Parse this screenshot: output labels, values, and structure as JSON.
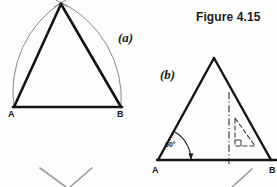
{
  "figure": {
    "title": "Figure 4.15",
    "background_color": "#fdfdfc",
    "ink_color": "#1a1a1a",
    "construction_line_color": "#6b6b6b"
  },
  "parts": [
    {
      "key": "a",
      "label": "(a)",
      "caption_position": "right-of-diagram",
      "description": "Equilateral triangle constructed on base AB using two intersecting arcs of radius AB",
      "vertices": [
        {
          "name": "A",
          "label": "A",
          "x": 14,
          "y": 107
        },
        {
          "name": "B",
          "label": "B",
          "x": 121,
          "y": 107
        },
        {
          "name": "apex",
          "label": "",
          "x": 61,
          "y": 4
        }
      ],
      "construction_arcs": [
        {
          "name": "arc-centre-A",
          "centre": "A",
          "radius": 107
        },
        {
          "name": "arc-centre-B",
          "centre": "B",
          "radius": 107
        }
      ]
    },
    {
      "key": "b",
      "label": "(b)",
      "caption_position": "left-of-diagram",
      "description": "Equilateral triangle on base AB set out with a 60 degree angle at A and a vertical centre line with set-square symbol",
      "vertices": [
        {
          "name": "A",
          "label": "A",
          "x": 158,
          "y": 160
        },
        {
          "name": "B",
          "label": "B",
          "x": 271,
          "y": 160
        },
        {
          "name": "apex",
          "label": "",
          "x": 214,
          "y": 58
        }
      ],
      "angle": {
        "name": "base-angle-at-A",
        "value": "60",
        "unit": "degrees",
        "text": "60°",
        "at_vertex": "A"
      },
      "centre_line": {
        "name": "vertical-centre-line",
        "style": "dash-dot",
        "x": 229,
        "y_top": 92,
        "y_bottom": 163
      },
      "set_square": {
        "name": "set-square-symbol",
        "style": "60-degree set square outline",
        "x": 233,
        "y": 118,
        "width": 24,
        "height": 30
      }
    }
  ],
  "cut_off_fragments": [
    {
      "name": "fragment-left-1",
      "x1": 40,
      "y1": 168,
      "x2": 66,
      "y2": 187
    },
    {
      "name": "fragment-left-2",
      "x1": 92,
      "y1": 168,
      "x2": 70,
      "y2": 187
    },
    {
      "name": "fragment-right-1",
      "x1": 252,
      "y1": 169,
      "x2": 232,
      "y2": 187
    }
  ]
}
